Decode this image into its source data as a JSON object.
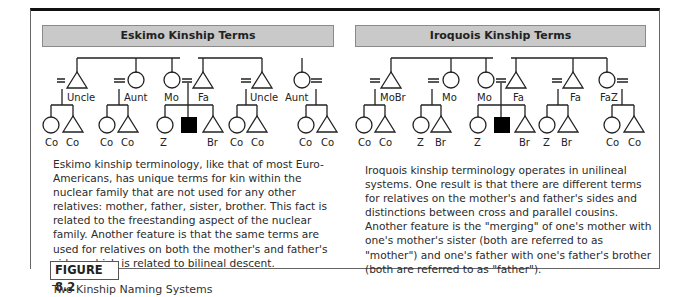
{
  "figure": {
    "label": "FIGURE 8.2",
    "caption": "Two Kinship Naming Systems"
  },
  "eskimo": {
    "title": "Eskimo Kinship Terms",
    "parents_gen": [
      "Uncle",
      "Aunt",
      "Mo",
      "Fa",
      "Uncle",
      "Aunt"
    ],
    "children_gen": [
      "Co",
      "Co",
      "Co",
      "Co",
      "Z",
      "Br",
      "Co",
      "Co",
      "Co",
      "Co"
    ],
    "description": "Eskimo kinship terminology, like that of most Euro-Americans, has unique terms for kin within the nuclear family that are not used for any other relatives: mother, father, sister, brother. This fact is related to the freestanding aspect of the nuclear family. Another feature is that the same terms are used for relatives on both the mother's and father's sides, which is related to bilineal descent."
  },
  "iroquois": {
    "title": "Iroquois Kinship Terms",
    "parents_gen": [
      "MoBr",
      "Mo",
      "Mo",
      "Fa",
      "Fa",
      "FaZ"
    ],
    "children_gen": [
      "Co",
      "Co",
      "Z",
      "Br",
      "Z",
      "Br",
      "Z",
      "Br",
      "Co",
      "Co"
    ],
    "description": "Iroquois kinship terminology operates in unilineal systems. One result is that there are different terms for relatives on the mother's and father's sides and distinctions  between cross and parallel cousins. Another feature is the  \"merging\" of one's mother with one's mother's sister (both are  referred to as \"mother\") and one's father with one's father's brother (both are referred to as \"father\")."
  },
  "colors": {
    "title_bar": "#c9c9c9",
    "ego_fill": "#000000",
    "line": "#222222"
  }
}
